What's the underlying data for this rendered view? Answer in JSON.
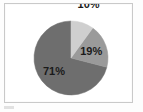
{
  "figure": {
    "border_color": "#c9c9c9",
    "background": "#ffffff"
  },
  "legend_remnant": {
    "name": "legend-swatch-remnant",
    "color": "#dcdcdc"
  },
  "chart_data": {
    "type": "pie",
    "title": "",
    "subtitle": "",
    "xlabel": "",
    "ylabel": "",
    "grid": false,
    "legend_position": "none",
    "start_angle_deg": 90,
    "direction": "counterclockwise",
    "categories": [
      "10%",
      "19%",
      "71%"
    ],
    "values": [
      10,
      19,
      71
    ],
    "labels": [
      "10%",
      "19%",
      "71%"
    ],
    "colors": [
      "#cfcfcf",
      "#9a9a9a",
      "#6e6e6e"
    ],
    "label_positions": [
      "outside",
      "inside",
      "inside"
    ],
    "slices": [
      {
        "label": "10%",
        "value": 10,
        "color": "#cfcfcf",
        "label_position": "outside"
      },
      {
        "label": "19%",
        "value": 19,
        "color": "#9a9a9a",
        "label_position": "inside"
      },
      {
        "label": "71%",
        "value": 71,
        "color": "#6e6e6e",
        "label_position": "inside"
      }
    ]
  }
}
